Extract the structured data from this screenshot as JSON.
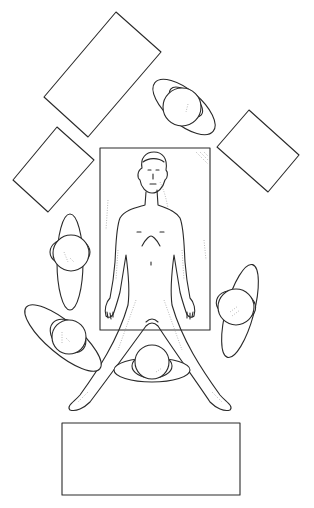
{
  "diagram": {
    "type": "operating-room-layout-illustration",
    "colors": {
      "line": "#2a2a2a",
      "background": "#ffffff",
      "shading": "#8a8a8a"
    },
    "operating_table": {
      "x": 100,
      "y": 148,
      "width": 110,
      "height": 182
    },
    "patient": {
      "pose": "supine, legs abducted",
      "head_at": [
        152,
        165
      ],
      "feet_at": [
        [
          72,
          410
        ],
        [
          228,
          410
        ]
      ]
    },
    "instrument_tables": [
      {
        "id": "top-left-large",
        "points": [
          [
            116,
            12
          ],
          [
            161,
            52
          ],
          [
            88,
            137
          ],
          [
            44,
            97
          ]
        ]
      },
      {
        "id": "left-small",
        "points": [
          [
            57,
            127
          ],
          [
            94,
            160
          ],
          [
            48,
            212
          ],
          [
            13,
            180
          ]
        ]
      },
      {
        "id": "right",
        "points": [
          [
            249,
            110
          ],
          [
            299,
            155
          ],
          [
            268,
            192
          ],
          [
            217,
            147
          ]
        ]
      },
      {
        "id": "bottom",
        "x": 62,
        "y": 423,
        "width": 178,
        "height": 72
      }
    ],
    "staff": [
      {
        "id": "top-right",
        "body": {
          "cx": 184,
          "cy": 107,
          "rx": 38,
          "ry": 17,
          "rotate": 40
        },
        "head": {
          "cx": 182,
          "cy": 106,
          "r": 19
        }
      },
      {
        "id": "left-middle",
        "body": {
          "cx": 70,
          "cy": 262,
          "rx": 13,
          "ry": 48,
          "rotate": 0
        },
        "head": {
          "cx": 71,
          "cy": 253,
          "r": 18
        }
      },
      {
        "id": "right-middle",
        "body": {
          "cx": 240,
          "cy": 311,
          "rx": 14,
          "ry": 48,
          "rotate": 15
        },
        "head": {
          "cx": 236,
          "cy": 307,
          "r": 18
        }
      },
      {
        "id": "bottom-left",
        "body": {
          "cx": 63,
          "cy": 338,
          "rx": 48,
          "ry": 16,
          "rotate": 40
        },
        "head": {
          "cx": 69,
          "cy": 337,
          "r": 17
        }
      },
      {
        "id": "bottom-center",
        "body": {
          "cx": 152,
          "cy": 370,
          "rx": 38,
          "ry": 12,
          "rotate": 0
        },
        "head": {
          "cx": 152,
          "cy": 362,
          "r": 17
        }
      }
    ]
  }
}
